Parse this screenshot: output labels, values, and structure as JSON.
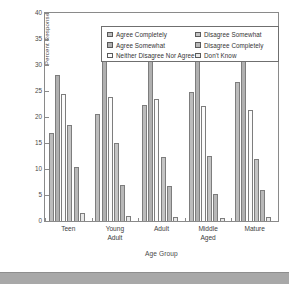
{
  "chart_data": {
    "type": "bar",
    "title": "",
    "subtitle": "",
    "xlabel": "Age Group",
    "ylabel": "Percent Response",
    "categories": [
      "Teen",
      "Young\nAdult",
      "Adult",
      "Middle\nAged",
      "Mature"
    ],
    "ylim": [
      0,
      40
    ],
    "yticks": [
      0,
      5,
      10,
      15,
      20,
      25,
      30,
      35,
      40
    ],
    "ytick_labels": [
      "0",
      "5",
      "10",
      "15",
      "20",
      "25",
      "30",
      "35",
      "40"
    ],
    "grid": false,
    "legend_position": "top-inside",
    "series": [
      {
        "name": "Agree Completely",
        "color": "#bcbcbc",
        "values": [
          17.0,
          20.6,
          22.4,
          24.9,
          26.8
        ]
      },
      {
        "name": "Agree Somewhat",
        "color": "#b0b0b0",
        "values": [
          28.1,
          32.7,
          35.0,
          35.4,
          34.0
        ]
      },
      {
        "name": "Neither Disagree Nor Agree",
        "color": "#fbfbfb",
        "values": [
          24.5,
          23.8,
          23.4,
          22.2,
          21.3
        ]
      },
      {
        "name": "Disagree Somewhat",
        "color": "#c4c4c4",
        "values": [
          18.5,
          15.0,
          12.3,
          12.5,
          11.9
        ]
      },
      {
        "name": "Disagree Completely",
        "color": "#b8b8b8",
        "values": [
          10.3,
          7.0,
          6.7,
          5.2,
          6.0
        ]
      },
      {
        "name": "Don't Know",
        "color": "#e8e8e8",
        "values": [
          1.5,
          1.0,
          0.8,
          0.6,
          0.7
        ]
      }
    ]
  },
  "legend": {
    "column_left": [
      "Agree Completely",
      "Agree Somewhat",
      "Neither Disagree Nor Agree"
    ],
    "column_right": [
      "Disagree Somewhat",
      "Disagree Completely",
      "Don't Know"
    ]
  },
  "axes": {
    "y_title": "Percent Response",
    "x_title": "Age Group"
  }
}
